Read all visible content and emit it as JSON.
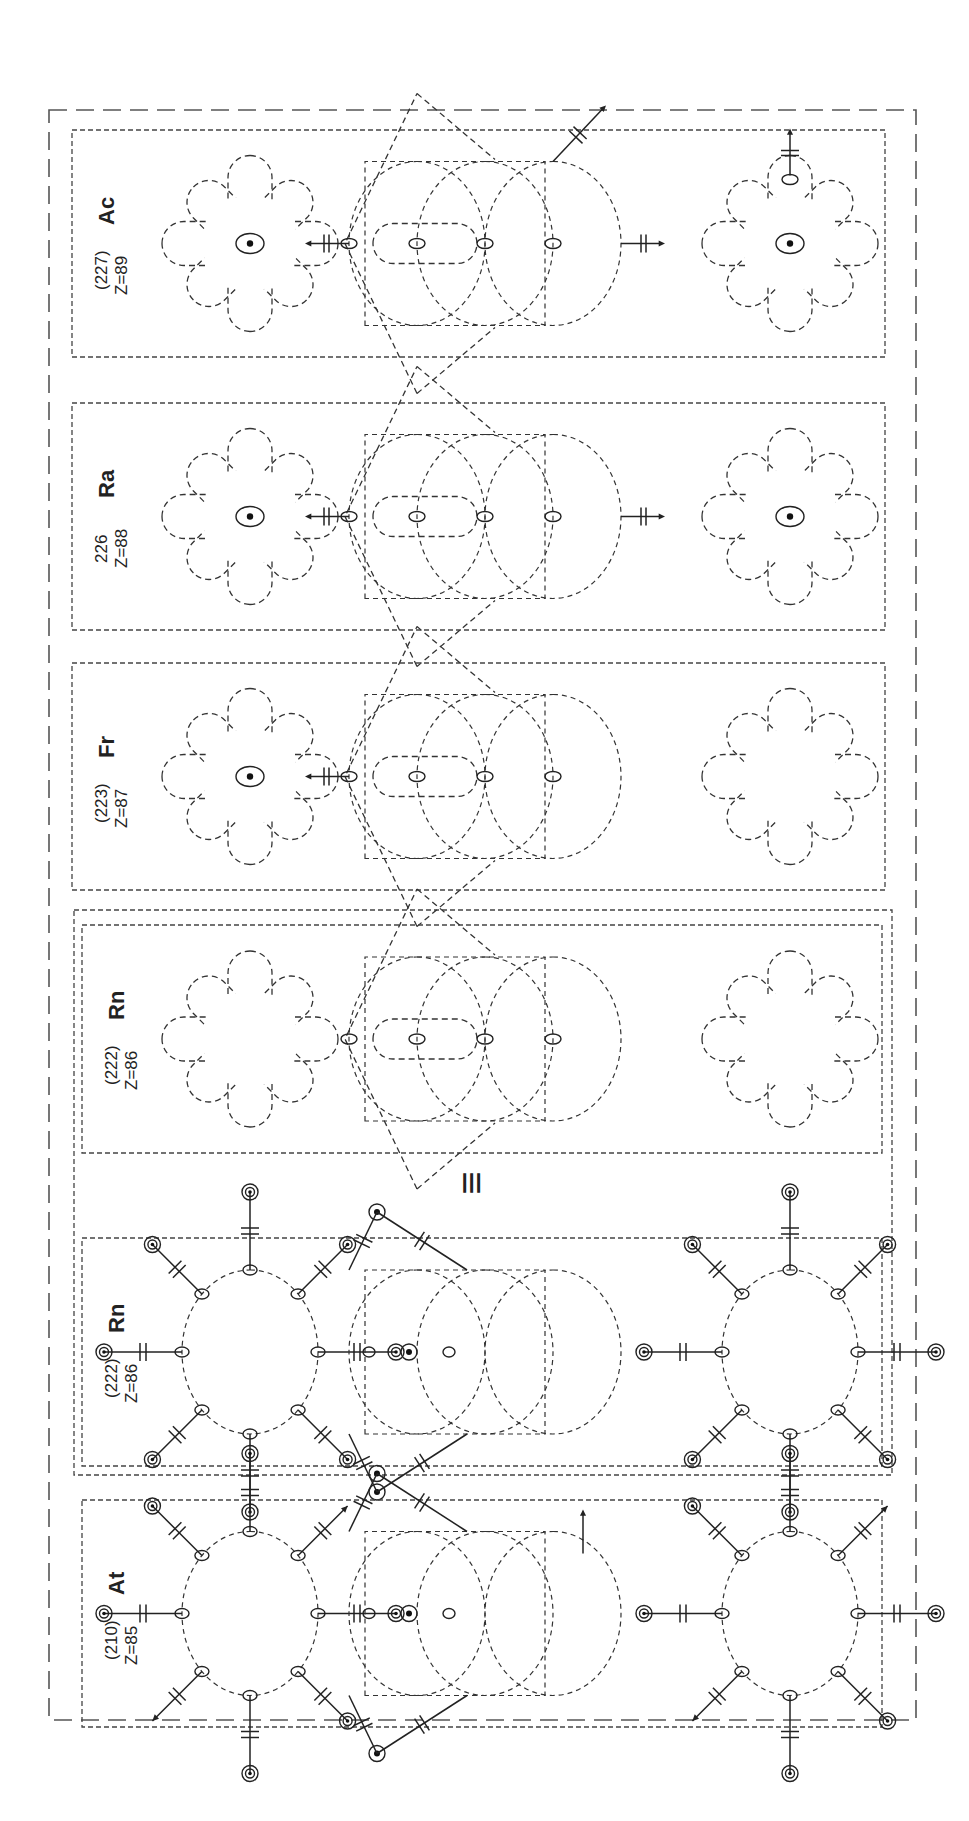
{
  "figure": {
    "orientation": "rotated-90-ccw",
    "equivalence_symbol": "≡",
    "colors": {
      "ink": "#222222",
      "dash": "#444444",
      "background": "#ffffff"
    }
  },
  "panels": [
    {
      "id": "ac",
      "symbol": "Ac",
      "mass": "(227)",
      "z_label": "Z=89",
      "style": "orbital-flower",
      "top_center_dot": true,
      "bottom_center_dot": true,
      "middle_arrows": [
        "left",
        "right",
        "up-right"
      ],
      "bottom_arrow": "up"
    },
    {
      "id": "ra",
      "symbol": "Ra",
      "mass": "226",
      "z_label": "Z=88",
      "style": "orbital-flower",
      "top_center_dot": true,
      "bottom_center_dot": true,
      "middle_arrows": [
        "left",
        "right"
      ],
      "bottom_arrow": ""
    },
    {
      "id": "fr",
      "symbol": "Fr",
      "mass": "(223)",
      "z_label": "Z=87",
      "style": "orbital-flower",
      "top_center_dot": true,
      "bottom_center_dot": false,
      "middle_arrows": [
        "left"
      ],
      "bottom_arrow": ""
    },
    {
      "id": "rn-orbital",
      "symbol": "Rn",
      "mass": "(222)",
      "z_label": "Z=86",
      "style": "orbital-flower",
      "top_center_dot": false,
      "bottom_center_dot": false,
      "middle_arrows": [],
      "bottom_arrow": ""
    },
    {
      "id": "rn-bond",
      "symbol": "Rn",
      "mass": "(222)",
      "z_label": "Z=86",
      "style": "bond-star",
      "variant": "full"
    },
    {
      "id": "at",
      "symbol": "At",
      "mass": "(210)",
      "z_label": "Z=85",
      "style": "bond-star",
      "variant": "arrows"
    }
  ],
  "chart_data": {
    "type": "diagram",
    "title": "",
    "elements": [
      {
        "symbol": "Ac",
        "mass": "(227)",
        "Z": 89
      },
      {
        "symbol": "Ra",
        "mass": "226",
        "Z": 88
      },
      {
        "symbol": "Fr",
        "mass": "(223)",
        "Z": 87
      },
      {
        "symbol": "Rn",
        "mass": "(222)",
        "Z": 86
      },
      {
        "symbol": "Rn",
        "mass": "(222)",
        "Z": 86
      },
      {
        "symbol": "At",
        "mass": "(210)",
        "Z": 85
      }
    ]
  }
}
